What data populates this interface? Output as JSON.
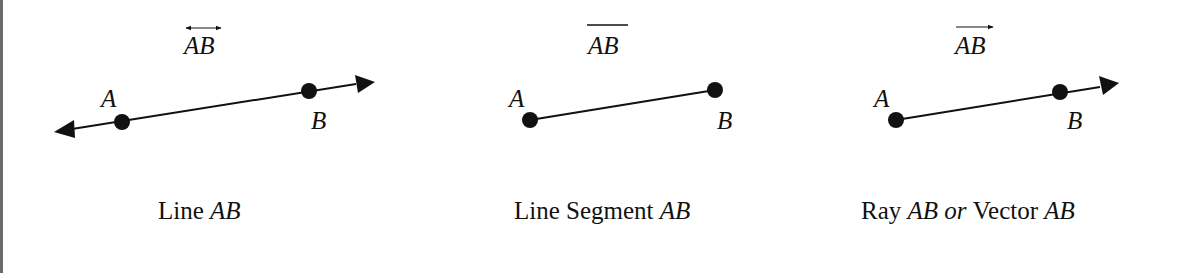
{
  "figures": [
    {
      "id": "line",
      "notation": "AB",
      "notation_mark": "double-arrow-overline",
      "points": [
        {
          "label": "A"
        },
        {
          "label": "B"
        }
      ],
      "caption": {
        "prefix": "Line ",
        "italic": "AB"
      }
    },
    {
      "id": "segment",
      "notation": "AB",
      "notation_mark": "overline",
      "points": [
        {
          "label": "A"
        },
        {
          "label": "B"
        }
      ],
      "caption": {
        "prefix": "Line Segment ",
        "italic": "AB"
      }
    },
    {
      "id": "ray",
      "notation": "AB",
      "notation_mark": "right-arrow-overline",
      "points": [
        {
          "label": "A"
        },
        {
          "label": "B"
        }
      ],
      "caption": {
        "prefix": "Ray ",
        "italic": "AB",
        "middle_italic": " or ",
        "suffix": "Vector ",
        "italic2": "AB"
      }
    }
  ],
  "colors": {
    "stroke": "#111111",
    "border": "#6a6a6a",
    "background": "#ffffff"
  }
}
